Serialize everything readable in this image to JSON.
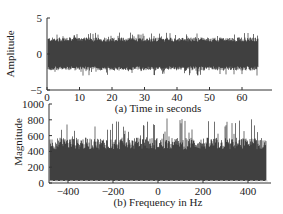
{
  "chart_data": [
    {
      "type": "line",
      "title": "(a) Time in seconds",
      "xlabel": "",
      "ylabel": "Amplitude",
      "xlim": [
        0,
        70
      ],
      "ylim": [
        -5,
        5
      ],
      "xticks": [
        0,
        10,
        20,
        30,
        40,
        50,
        60
      ],
      "yticks": [
        -5,
        0,
        5
      ],
      "series": [
        {
          "name": "signal",
          "description": "dense noise-like signal",
          "x_range": [
            0,
            65
          ],
          "typical_amplitude": 2.3,
          "peak_amplitude": 3.0
        }
      ],
      "grid": false
    },
    {
      "type": "line",
      "title": "(b) Frequency in Hz",
      "xlabel": "",
      "ylabel": "Magnitude",
      "xlim": [
        -500,
        500
      ],
      "ylim": [
        0,
        1000
      ],
      "xticks": [
        -400,
        -200,
        0,
        200,
        400
      ],
      "yticks": [
        0,
        200,
        400,
        600,
        800,
        1000
      ],
      "series": [
        {
          "name": "spectrum",
          "description": "flat noise-like spectrum",
          "x_range": [
            -480,
            480
          ],
          "typical_magnitude": 500,
          "peak_magnitude": 820
        }
      ],
      "grid": false
    }
  ]
}
